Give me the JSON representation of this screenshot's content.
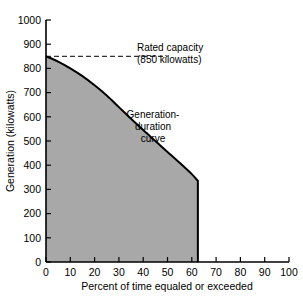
{
  "chart_data": {
    "type": "area",
    "title": "",
    "subtitle": "",
    "xlabel": "Percent of time equaled or exceeded",
    "ylabel": "Generation (kilowatts)",
    "xlim": [
      0,
      100
    ],
    "ylim": [
      0,
      1000
    ],
    "grid": false,
    "legend_position": "none",
    "x_ticks": [
      0,
      10,
      20,
      30,
      40,
      50,
      60,
      70,
      80,
      90,
      100
    ],
    "x_tick_labels": [
      "0",
      "10",
      "20",
      "30",
      "40",
      "50",
      "60",
      "70",
      "80",
      "90",
      "100"
    ],
    "y_ticks": [
      0,
      100,
      200,
      300,
      400,
      500,
      600,
      700,
      800,
      900,
      1000
    ],
    "y_tick_labels": [
      "0",
      "100",
      "200",
      "300",
      "400",
      "500",
      "600",
      "700",
      "800",
      "900",
      "1000"
    ],
    "series": [
      {
        "name": "Generation-duration curve",
        "fill_color": "#a8a8a8",
        "line_color": "#000000",
        "x": [
          0,
          5,
          10,
          15,
          20,
          25,
          30,
          35,
          40,
          45,
          50,
          55,
          60,
          62.5,
          62.5
        ],
        "values": [
          850,
          828,
          800,
          768,
          730,
          688,
          640,
          592,
          545,
          500,
          455,
          410,
          363,
          335,
          0
        ]
      }
    ],
    "reference_lines": [
      {
        "name": "rated-capacity",
        "orientation": "horizontal",
        "value": 850,
        "style": "dashed",
        "x_start": 0,
        "x_end": 50,
        "color": "#000000"
      }
    ],
    "annotations": [
      {
        "name": "rated-capacity-annotation",
        "lines": [
          "Rated capacity",
          "(850 kilowatts)"
        ],
        "align": "left"
      },
      {
        "name": "curve-annotation",
        "lines": [
          "Generation-",
          "duration",
          "curve"
        ],
        "align": "center"
      }
    ]
  },
  "colors": {
    "fill": "#a8a8a8",
    "line": "#000000",
    "axis": "#000000",
    "background": "#ffffff"
  }
}
